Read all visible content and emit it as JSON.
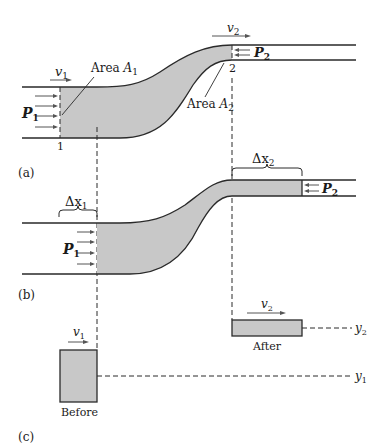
{
  "figure": {
    "panels": {
      "a": {
        "label": "(a)",
        "v1": "v",
        "v1_sub": "1",
        "v2": "v",
        "v2_sub": "2",
        "P1": "P",
        "P1_sub": "1",
        "P2": "P",
        "P2_sub": "2",
        "area1": "Area ",
        "area1_var": "A",
        "area1_sub": "1",
        "area2": "Area ",
        "area2_var": "A",
        "area2_sub": "2",
        "section1": "1",
        "section2": "2"
      },
      "b": {
        "label": "(b)",
        "dx1": "Δx",
        "dx1_sub": "1",
        "dx2": "Δx",
        "dx2_sub": "2",
        "P1": "P",
        "P1_sub": "1",
        "P2": "P",
        "P2_sub": "2"
      },
      "c": {
        "label": "(c)",
        "before": "Before",
        "after": "After",
        "v1": "v",
        "v1_sub": "1",
        "v2": "v",
        "v2_sub": "2",
        "y1": "y",
        "y1_sub": "1",
        "y2": "y",
        "y2_sub": "2"
      }
    },
    "colors": {
      "fluid_fill": "#c8c8c8",
      "line": "#2a2a2a",
      "arrow": "#555555"
    }
  }
}
